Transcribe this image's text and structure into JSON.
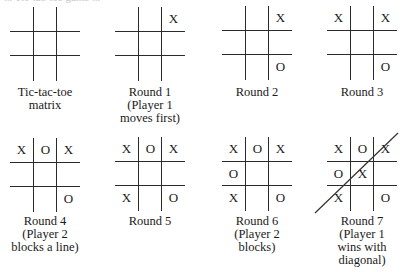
{
  "figure": {
    "top_cutoff_text": "... Tic-tac-toe game ...",
    "boards": [
      {
        "id": "matrix",
        "caption": [
          "Tic-tac-toe",
          "matrix"
        ],
        "cells": [
          "",
          "",
          "",
          "",
          "",
          "",
          "",
          "",
          ""
        ]
      },
      {
        "id": "round-1",
        "caption": [
          "Round 1",
          "(Player 1",
          "moves first)"
        ],
        "cells": [
          "",
          "",
          "X",
          "",
          "",
          "",
          "",
          "",
          ""
        ]
      },
      {
        "id": "round-2",
        "caption": [
          "Round 2"
        ],
        "cells": [
          "",
          "",
          "X",
          "",
          "",
          "",
          "",
          "",
          "O"
        ]
      },
      {
        "id": "round-3",
        "caption": [
          "Round 3"
        ],
        "cells": [
          "X",
          "",
          "X",
          "",
          "",
          "",
          "",
          "",
          "O"
        ]
      },
      {
        "id": "round-4",
        "caption": [
          "Round 4",
          "(Player 2",
          "blocks a line)"
        ],
        "cells": [
          "X",
          "O",
          "X",
          "",
          "",
          "",
          "",
          "",
          "O"
        ]
      },
      {
        "id": "round-5",
        "caption": [
          "Round 5"
        ],
        "cells": [
          "X",
          "O",
          "X",
          "",
          "",
          "",
          "X",
          "",
          "O"
        ]
      },
      {
        "id": "round-6",
        "caption": [
          "Round 6",
          "(Player 2",
          "blocks)"
        ],
        "cells": [
          "X",
          "O",
          "X",
          "O",
          "",
          "",
          "X",
          "",
          "O"
        ]
      },
      {
        "id": "round-7",
        "caption": [
          "Round 7",
          "(Player 1",
          "wins with",
          "diagonal)"
        ],
        "cells": [
          "X",
          "O",
          "X",
          "O",
          "X",
          "",
          "X",
          "",
          "O"
        ],
        "winning_line": "diagonal"
      }
    ]
  }
}
